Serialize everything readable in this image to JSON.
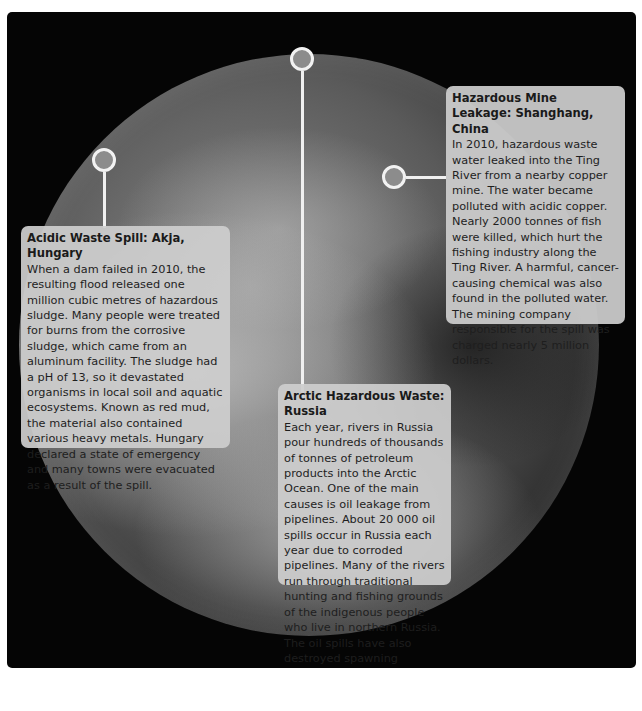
{
  "cards": {
    "hungary": {
      "title": "Acidic Waste Spill: Akja, Hungary",
      "body": "When a dam failed in 2010, the resulting flood released one million cubic metres of hazardous sludge. Many people were treated for burns from the corrosive sludge, which came from an aluminum facility. The sludge had a pH of 13, so it devastated organisms in local soil and aquatic ecosystems. Known as red mud, the material also contained various heavy metals. Hungary declared a state of emergency and many towns were evacuated as a result of the spill."
    },
    "china": {
      "title": "Hazardous Mine Leakage: Shanghang, China",
      "body": "In 2010, hazardous waste water leaked into the Ting River from a nearby copper mine. The water became polluted with acidic copper. Nearly 2000 tonnes of fish were killed, which hurt the fishing industry along the Ting River. A harmful, cancer-causing chemical was also found in the polluted water. The mining company responsible for the spill was charged nearly 5 million dollars."
    },
    "russia": {
      "title": "Arctic Hazardous Waste: Russia",
      "body": "Each year, rivers in Russia pour hundreds of thousands of tonnes of petroleum products into the Arctic Ocean. One of the main causes is oil leakage from pipelines. About 20 000 oil spills occur in Russia each year due to corroded pipelines. Many of the rivers run through traditional hunting and fishing grounds of the indigenous people who live in northern Russia. The oil spills have also destroyed spawning grounds in the rivers, and fish populations have declined."
    }
  },
  "colors": {
    "background": "#050505",
    "card": "#cdcdcd",
    "pin_ring": "#f2f2f2"
  }
}
